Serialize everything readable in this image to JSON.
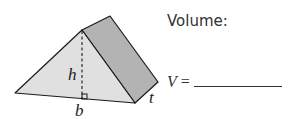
{
  "diagram": {
    "type": "triangular-prism",
    "labels": {
      "height": "h",
      "base": "b",
      "thickness": "t"
    },
    "colors": {
      "front_face": "#e0e0e0",
      "side_face": "#b3b3b3",
      "edge": "#1a1a1a"
    }
  },
  "question": {
    "title": "Volume:",
    "answer_variable": "V",
    "equals": "=",
    "answer_value": ""
  }
}
